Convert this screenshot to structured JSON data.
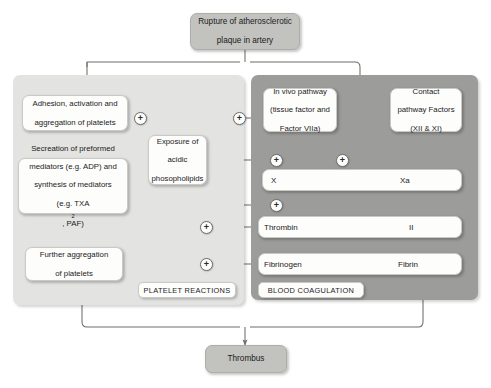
{
  "diagram": {
    "title_node": {
      "line1": "Rupture of atherosclerotic",
      "line2": "plaque in artery"
    },
    "outcome_node": {
      "label": "Thrombus"
    },
    "panels": {
      "left": {
        "tag": "PLATELET REACTIONS",
        "color": "#e3e3e1"
      },
      "right": {
        "tag": "BLOOD COAGULATION",
        "color": "#9c9c9a"
      }
    },
    "platelet_nodes": [
      {
        "id": "adhesion",
        "line1": "Adhesion, activation and",
        "line2": "aggregation of platelets"
      },
      {
        "id": "secretion",
        "line1": "Secreation of preformed",
        "line2": "mediators (e.g. ADP) and",
        "line3": "synthesis of mediators",
        "line4": "(e.g. TXA",
        "line4_sub": "2",
        "line4_end": ", PAF)"
      },
      {
        "id": "further-aggregation",
        "line1": "Further aggregation",
        "line2": "of platelets"
      }
    ],
    "shared_nodes": [
      {
        "id": "phospholipids",
        "line1": "Exposure of",
        "line2": "acidic",
        "line3": "phosopholipids"
      }
    ],
    "coagulation_nodes": [
      {
        "id": "in-vivo-pathway",
        "line1": "In vivo pathway",
        "line2": "(tissue factor and",
        "line3": "Factor VIIa)"
      },
      {
        "id": "contact-pathway",
        "line1": "Contact",
        "line2": "pathway Factors",
        "line3": "(XII & XI)"
      }
    ],
    "reaction_rows": [
      {
        "id": "factor-x",
        "left": "X",
        "right": "Xa"
      },
      {
        "id": "thrombin",
        "left": "Thrombin",
        "right": "II"
      },
      {
        "id": "fibrin",
        "left": "Fibrinogen",
        "right": "Fibrin"
      }
    ],
    "activation_markers": [
      {
        "id": "plus-adhesion-to-phospholipids",
        "symbol": "+"
      },
      {
        "id": "plus-phospholipids-to-invivo",
        "symbol": "+"
      },
      {
        "id": "plus-phospholipids-to-x",
        "symbol": "+"
      },
      {
        "id": "plus-phospholipids-to-xa",
        "symbol": "+"
      },
      {
        "id": "plus-phospholipids-to-thrombin-path",
        "symbol": "+"
      },
      {
        "id": "plus-thrombin-to-platelets",
        "symbol": "+"
      },
      {
        "id": "plus-fibrin-to-aggregation",
        "symbol": "+"
      }
    ]
  }
}
